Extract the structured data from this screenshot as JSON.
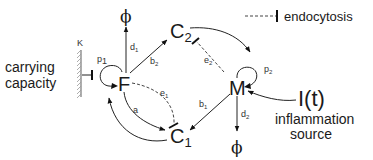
{
  "nodes": {
    "F": {
      "label": "F"
    },
    "M": {
      "label": "M"
    },
    "c1": {
      "label": "C",
      "subscript": "1"
    },
    "c2": {
      "label": "C",
      "subscript": "2"
    },
    "phi_top": {
      "label": "ϕ"
    },
    "phi_bottom": {
      "label": "ϕ"
    },
    "input": {
      "label": "I(t)"
    }
  },
  "parameters": {
    "K": "K",
    "p1": {
      "label": "p",
      "subscript": "1"
    },
    "p2": {
      "label": "p",
      "subscript": "2"
    },
    "d1": {
      "label": "d",
      "subscript": "1"
    },
    "d2": {
      "label": "d",
      "subscript": "2"
    },
    "b1": {
      "label": "b",
      "subscript": "1"
    },
    "b2": {
      "label": "b",
      "subscript": "2"
    },
    "e1": {
      "label": "e",
      "subscript": "1"
    },
    "e2": {
      "label": "e",
      "subscript": "2"
    },
    "a": "a"
  },
  "annotations": {
    "carrying_line1": "carrying",
    "carrying_line2": "capacity",
    "inflammation_line1": "inflammation",
    "inflammation_line2": "source"
  },
  "legend": {
    "endocytosis": "endocytosis"
  },
  "edges": [
    {
      "from": "F",
      "to": "phi_top",
      "label": "d1",
      "style": "arrow"
    },
    {
      "from": "F",
      "to": "c2",
      "label": "b2",
      "style": "arrow"
    },
    {
      "from": "F",
      "to": "F",
      "label": "p1",
      "style": "self-loop"
    },
    {
      "from": "K",
      "to": "F",
      "label": "",
      "style": "inhibition"
    },
    {
      "from": "F",
      "to": "c1",
      "label": "a",
      "style": "arrow"
    },
    {
      "from": "c1",
      "to": "F",
      "label": "",
      "style": "arrow"
    },
    {
      "from": "F",
      "to": "c1",
      "label": "e1",
      "style": "dashed-inhibition"
    },
    {
      "from": "c2",
      "to": "M",
      "label": "",
      "style": "arrow"
    },
    {
      "from": "M",
      "to": "c2",
      "label": "e2",
      "style": "dashed-inhibition"
    },
    {
      "from": "M",
      "to": "M",
      "label": "p2",
      "style": "self-loop"
    },
    {
      "from": "M",
      "to": "c1",
      "label": "b1",
      "style": "arrow"
    },
    {
      "from": "M",
      "to": "phi_bottom",
      "label": "d2",
      "style": "arrow"
    },
    {
      "from": "input",
      "to": "M",
      "label": "",
      "style": "arrow"
    }
  ]
}
